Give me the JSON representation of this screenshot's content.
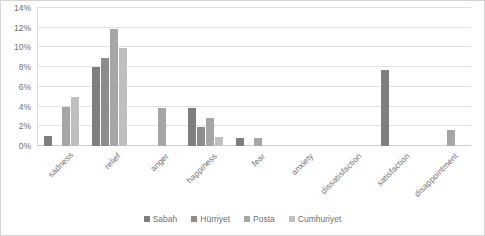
{
  "chart_data": {
    "type": "bar",
    "title": "",
    "subtitle": "",
    "xlabel": "",
    "ylabel": "",
    "grid": true,
    "legend_position": "bottom",
    "ylim": [
      0,
      14
    ],
    "yticks": [
      "0%",
      "2%",
      "4%",
      "6%",
      "8%",
      "10%",
      "12%",
      "14%"
    ],
    "ytick_values": [
      0,
      2,
      4,
      6,
      8,
      10,
      12,
      14
    ],
    "categories": [
      "sadness",
      "relief",
      "anger",
      "happiness",
      "fear",
      "anxiety",
      "dissatisfaction",
      "satisfaction",
      "disappointment"
    ],
    "series": [
      {
        "name": "Sabah",
        "color": "#7f7f7f",
        "values": [
          1.0,
          8.0,
          0,
          3.9,
          0.8,
          0,
          0,
          7.7,
          0
        ]
      },
      {
        "name": "Hürriyet",
        "color": "#8c8c8c",
        "values": [
          0,
          8.9,
          0,
          1.9,
          0,
          0,
          0,
          0,
          0
        ]
      },
      {
        "name": "Posta",
        "color": "#a6a6a6",
        "values": [
          4.0,
          11.9,
          3.9,
          2.8,
          0.8,
          0,
          0,
          0,
          1.6
        ]
      },
      {
        "name": "Cumhuriyet",
        "color": "#bfbfbf",
        "values": [
          5.0,
          9.9,
          0,
          0.9,
          0,
          0,
          0,
          0,
          0
        ]
      }
    ]
  },
  "colors": {
    "frame_border": "#d4d4d4",
    "gridline": "#e2e2e2",
    "axis_text": "#6f6f6f",
    "background": "#ffffff"
  }
}
